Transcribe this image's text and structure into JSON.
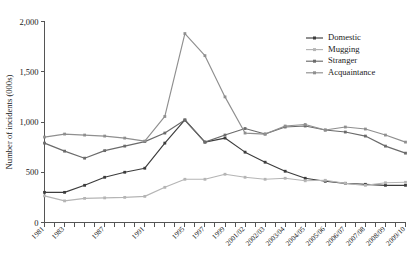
{
  "chart_data": {
    "type": "line",
    "title": "",
    "xlabel": "",
    "ylabel": "Number of incidents (000s)",
    "ylim": [
      0,
      2000
    ],
    "yticks": [
      0,
      500,
      1000,
      1500,
      2000
    ],
    "ytick_labels": [
      "0",
      "500",
      "1,000",
      "1,500",
      "2,000"
    ],
    "grid": false,
    "legend_position": "top-right",
    "categories": [
      "1981",
      "1983",
      "1985",
      "1987",
      "1989",
      "1991",
      "1993",
      "1995",
      "1997",
      "1999",
      "2001/02",
      "2002/03",
      "2003/04",
      "2004/05",
      "2005/06",
      "2006/07",
      "2007/08",
      "2008/09",
      "2009/10"
    ],
    "tick_labels_shown": [
      "1981",
      "1983",
      "1987",
      "1991",
      "1995",
      "1997",
      "1999",
      "2001/02",
      "2002/03",
      "2003/04",
      "2004/05",
      "2005/06",
      "2006/07",
      "2007/08",
      "2008/09",
      "2009/10"
    ],
    "series": [
      {
        "name": "Domestic",
        "color": "#3d3d3d",
        "values": [
          300,
          300,
          370,
          450,
          500,
          540,
          790,
          1020,
          800,
          840,
          700,
          600,
          510,
          440,
          410,
          390,
          380,
          370,
          370
        ]
      },
      {
        "name": "Mugging",
        "color": "#b5b5b5",
        "values": [
          265,
          215,
          240,
          245,
          250,
          260,
          350,
          430,
          430,
          480,
          450,
          430,
          440,
          415,
          420,
          390,
          370,
          395,
          400
        ]
      },
      {
        "name": "Stranger",
        "color": "#6b6b6b",
        "values": [
          790,
          710,
          640,
          715,
          760,
          805,
          890,
          1020,
          800,
          870,
          935,
          880,
          950,
          960,
          920,
          900,
          860,
          760,
          690
        ]
      },
      {
        "name": "Acquaintance",
        "color": "#8f8f8f",
        "values": [
          850,
          880,
          870,
          860,
          840,
          810,
          1055,
          1880,
          1660,
          1250,
          890,
          880,
          960,
          975,
          920,
          950,
          930,
          870,
          800
        ]
      }
    ]
  },
  "legend": {
    "items": [
      {
        "label": "Domestic",
        "color": "#3d3d3d"
      },
      {
        "label": "Mugging",
        "color": "#b5b5b5"
      },
      {
        "label": "Stranger",
        "color": "#6b6b6b"
      },
      {
        "label": "Acquaintance",
        "color": "#8f8f8f"
      }
    ]
  }
}
